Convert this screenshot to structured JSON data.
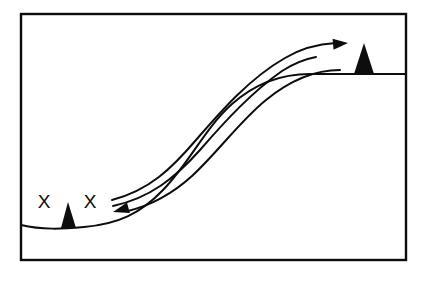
{
  "figure": {
    "background_color": "#ffffff",
    "ink_color": "#0d0d0d",
    "frame": {
      "name": "outer-border",
      "x": 21,
      "y": 14,
      "width": 385,
      "height": 246,
      "stroke_width": 2.4,
      "stroke_color": "#0d0d0d",
      "fill": "none"
    },
    "labels": {
      "x_mark_left": "X",
      "x_mark_right": "X"
    },
    "annotations": [
      {
        "name": "x-mark-left",
        "text": "X",
        "x": 44,
        "y": 208,
        "font_size": 19
      },
      {
        "name": "x-mark-right",
        "text": "X",
        "x": 90,
        "y": 208,
        "font_size": 19
      }
    ],
    "terrain": {
      "name": "ground-profile",
      "description": "S-shaped ground line rising from low-left valley to high-right plateau",
      "stroke_width": 2.0,
      "stroke_color": "#0d0d0d",
      "path": "M 21 225 C 42 230, 62 229, 84 227 C 118 224, 140 214, 163 190 C 190 162, 205 128, 232 104 C 258 81, 285 74, 310 74 L 406 74",
      "left_edge_y": 225,
      "valley_low_y": 228,
      "plateau_y": 74,
      "right_edge_y": 74
    },
    "peaks": [
      {
        "name": "peak-left-small",
        "description": "small dark triangular peak between the two X marks",
        "apex_x": 68,
        "apex_y": 202,
        "base_left_x": 61,
        "base_right_x": 76,
        "base_y": 228,
        "fill": "#0d0d0d"
      },
      {
        "name": "peak-right-large",
        "description": "larger dark triangular peak on the right plateau",
        "apex_x": 364,
        "apex_y": 43,
        "base_left_x": 354,
        "base_right_x": 374,
        "base_y": 74,
        "fill": "#0d0d0d"
      }
    ],
    "flow_arrows": [
      {
        "name": "flow-arrow-upslope",
        "direction": "right",
        "description": "uppermost curve sweeping up to the right, arrowhead at the plateau near the large peak",
        "stroke_width": 2.0,
        "path": "M 112 200 C 150 190, 172 168, 196 140 C 222 110, 250 78, 285 58 C 300 49, 318 44, 336 43",
        "arrowhead": {
          "name": "arrowhead-right",
          "tip_x": 348,
          "tip_y": 43,
          "length": 15,
          "half_width": 5.5,
          "fill": "#0d0d0d"
        }
      },
      {
        "name": "flow-line-middle",
        "direction": "none",
        "description": "middle curve with no arrowhead, terminating short of the plateau",
        "stroke_width": 2.0,
        "path": "M 113 206 C 150 198, 175 178, 200 150 C 226 120, 252 92, 282 71 C 293 64, 305 59, 316 57"
      },
      {
        "name": "flow-arrow-downslope",
        "direction": "left",
        "description": "lower curve sweeping down to the left, arrowhead pointing back toward the valley X marks",
        "stroke_width": 2.0,
        "path": "M 340 70 C 312 70, 288 82, 266 100 C 240 121, 218 152, 192 176 C 170 196, 148 206, 128 211",
        "arrowhead": {
          "name": "arrowhead-left",
          "tip_x": 113,
          "tip_y": 212,
          "length": 16,
          "half_width": 5.5,
          "fill": "#0d0d0d"
        }
      }
    ]
  }
}
